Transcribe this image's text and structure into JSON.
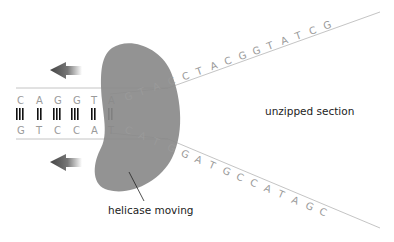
{
  "diagram": {
    "labels": {
      "unzipped": "unzipped section",
      "helicase": "helicase moving"
    },
    "top_strand_paired": [
      "C",
      "A",
      "G",
      "G",
      "T",
      "A"
    ],
    "bottom_strand_paired": [
      "G",
      "T",
      "C",
      "C",
      "A",
      "T"
    ],
    "bond_counts": [
      3,
      2,
      3,
      3,
      2,
      2
    ],
    "top_strand_unzipped": [
      "G",
      "T",
      "A",
      "C",
      "C",
      "T",
      "A",
      "C",
      "G",
      "G",
      "T",
      "A",
      "T",
      "C",
      "G"
    ],
    "bottom_strand_unzipped": [
      "C",
      "A",
      "T",
      "G",
      "G",
      "A",
      "T",
      "G",
      "C",
      "C",
      "A",
      "T",
      "A",
      "G",
      "C"
    ],
    "arrows": [
      {
        "direction": "left",
        "position": "top"
      },
      {
        "direction": "left",
        "position": "bottom"
      }
    ],
    "colors": {
      "helicase": "#8a8a8a",
      "strand_line": "#b5b5b5",
      "base_letter": "#9a9a9a",
      "bond": "#111111",
      "arrow": "#555555",
      "label": "#222222"
    }
  }
}
